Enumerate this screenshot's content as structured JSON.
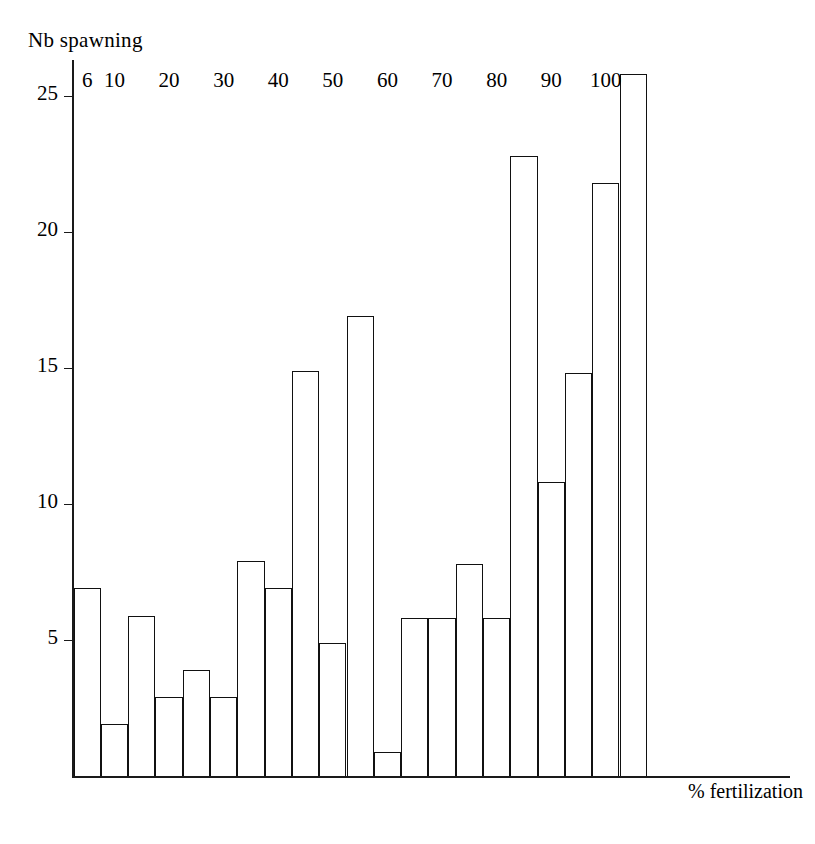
{
  "chart_data": {
    "type": "bar",
    "title": "",
    "ylabel": "Nb spawning",
    "xlabel": "% fertilization",
    "ylim": [
      0,
      26.5
    ],
    "xlim": [
      0,
      23
    ],
    "grid": false,
    "legend": null,
    "yticks": [
      5,
      10,
      15,
      20,
      25
    ],
    "xticks": [
      "6",
      "10",
      "20",
      "30",
      "40",
      "50",
      "60",
      "70",
      "80",
      "90",
      "100"
    ],
    "xtick_bar_index": [
      0,
      1,
      3,
      5,
      7,
      9,
      11,
      13,
      15,
      17,
      19
    ],
    "bar_style": "outline",
    "bin_width_percent": 5,
    "categories": [
      "6",
      "8",
      "10",
      "15",
      "20",
      "25",
      "30",
      "35",
      "40",
      "45",
      "50",
      "55",
      "60",
      "65",
      "70",
      "75",
      "80",
      "85",
      "90",
      "95",
      "100"
    ],
    "values": [
      6.9,
      1.9,
      5.9,
      2.9,
      3.9,
      2.9,
      7.9,
      6.9,
      14.9,
      4.9,
      16.9,
      0.9,
      5.8,
      5.8,
      7.8,
      5.8,
      22.8,
      10.8,
      14.8,
      21.8,
      25.8
    ]
  }
}
